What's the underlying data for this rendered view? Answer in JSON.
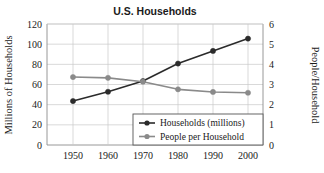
{
  "chart_data": {
    "type": "line",
    "title": "U.S. Households",
    "xlabel": "",
    "ylabel": "Millions of Households",
    "y2label": "People/Household",
    "x": [
      1950,
      1960,
      1970,
      1980,
      1990,
      2000
    ],
    "xtick_labels": [
      "1950",
      "1960",
      "1970",
      "1980",
      "1990",
      "2000"
    ],
    "ylim": [
      0,
      120
    ],
    "ytick_labels": [
      "0",
      "20",
      "40",
      "60",
      "80",
      "100",
      "120"
    ],
    "ytick_values": [
      0,
      20,
      40,
      60,
      80,
      100,
      120
    ],
    "y2lim": [
      0,
      6
    ],
    "y2tick_labels": [
      "0",
      "1",
      "2",
      "3",
      "4",
      "5",
      "6"
    ],
    "y2tick_values": [
      0,
      1,
      2,
      3,
      4,
      5,
      6
    ],
    "grid": true,
    "legend_position": "bottom-right",
    "series": [
      {
        "name": "Households (millions)",
        "axis": "left",
        "color": "#2b2b2b",
        "marker": "circle",
        "values": [
          43.6,
          52.8,
          63.4,
          80.8,
          93.3,
          105.5
        ]
      },
      {
        "name": "People per Household",
        "axis": "right",
        "color": "#8a8a8a",
        "marker": "circle",
        "values": [
          3.37,
          3.33,
          3.14,
          2.76,
          2.63,
          2.59
        ]
      }
    ]
  },
  "legend": {
    "items": [
      {
        "label": "Households (millions)",
        "color": "#2b2b2b"
      },
      {
        "label": "People per Household",
        "color": "#8a8a8a"
      }
    ]
  },
  "colors": {
    "households": "#2b2b2b",
    "people": "#8a8a8a",
    "grid": "#c9c9c9",
    "axis": "#8d8d8d",
    "text": "#1a1a1a",
    "background": "#ffffff"
  }
}
